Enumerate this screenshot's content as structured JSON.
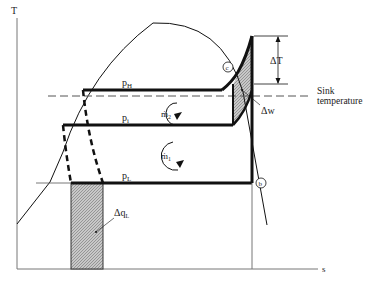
{
  "diagram": {
    "type": "T-s diagram",
    "axes": {
      "y_label": "T",
      "x_label": "s"
    },
    "isobars": {
      "high": "p",
      "high_sub": "H",
      "intermediate": "p",
      "intermediate_sub": "i",
      "low": "p",
      "low_sub": "L"
    },
    "flows": {
      "loop1": "ṁ",
      "loop1_sub": "1",
      "loop2": "ṁ",
      "loop2_sub": "2"
    },
    "states": {
      "b": "b",
      "c": "c"
    },
    "annotations": {
      "delta_T": "ΔT",
      "delta_w": "Δw",
      "delta_qL": "Δq",
      "delta_qL_sub": "L",
      "sink_line1": "Sink",
      "sink_line2": "temperature"
    },
    "colors": {
      "line": "#111111",
      "hatch": "#aaaaaa",
      "axis": "#777777"
    }
  }
}
